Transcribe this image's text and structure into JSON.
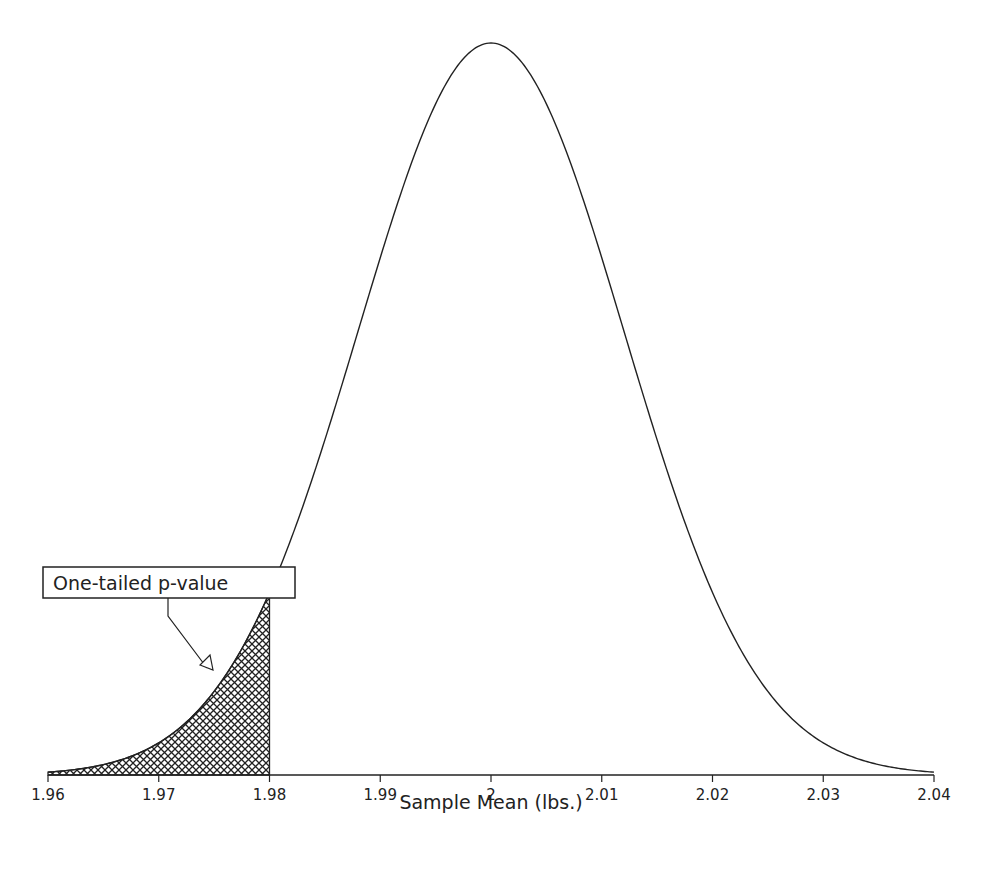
{
  "chart_data": {
    "type": "area",
    "title": "",
    "xlabel": "Sample Mean (lbs.)",
    "ylabel": "",
    "xlim": [
      1.96,
      2.04
    ],
    "xticks": [
      1.96,
      1.97,
      1.98,
      1.99,
      2,
      2.01,
      2.02,
      2.03,
      2.04
    ],
    "xtick_labels": [
      "1.96",
      "1.97",
      "1.98",
      "1.99",
      "2",
      "2.01",
      "2.02",
      "2.03",
      "2.04"
    ],
    "grid": false,
    "legend": null,
    "series": [
      {
        "name": "Sampling distribution of the mean",
        "distribution": "normal",
        "mean": 2.0,
        "sd": 0.012
      }
    ],
    "shaded_region": {
      "from": 1.96,
      "to": 1.98,
      "pattern": "crosshatch",
      "label": "One-tailed p-value"
    },
    "annotations": [
      {
        "text": "One-tailed p-value",
        "points_to_x": 1.975
      }
    ]
  },
  "colors": {
    "line": "#222222",
    "hatch": "#222222",
    "background": "#ffffff"
  }
}
